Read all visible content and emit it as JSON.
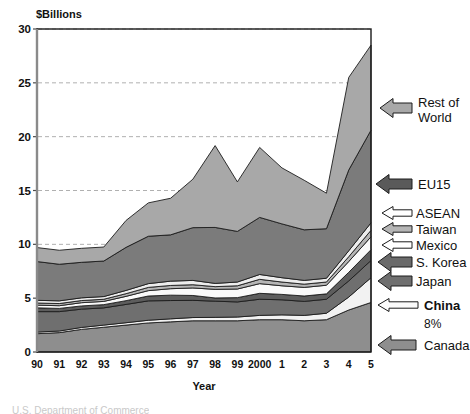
{
  "chart_data": {
    "type": "area",
    "title": "",
    "subtitle": "",
    "unit_label": "$Billions",
    "xlabel": "Year",
    "ylabel": "",
    "ylim": [
      0,
      30
    ],
    "yticks": [
      0,
      5,
      10,
      15,
      20,
      25,
      30
    ],
    "grid": "horizontal-dashed",
    "legend_position": "right-arrows",
    "stacked": true,
    "categories": [
      "90",
      "91",
      "92",
      "93",
      "94",
      "95",
      "96",
      "97",
      "98",
      "99",
      "2000",
      "1",
      "2",
      "3",
      "4",
      "5"
    ],
    "series": [
      {
        "name": "Canada",
        "color": "#8e8e8e",
        "values": [
          1.7,
          1.8,
          2.1,
          2.3,
          2.5,
          2.7,
          2.8,
          2.9,
          2.9,
          2.9,
          3.0,
          3.0,
          2.9,
          3.0,
          3.9,
          4.6
        ]
      },
      {
        "name": "China",
        "color": "#f2f2f2",
        "values": [
          0.15,
          0.15,
          0.18,
          0.2,
          0.22,
          0.25,
          0.28,
          0.3,
          0.32,
          0.35,
          0.4,
          0.45,
          0.5,
          0.6,
          1.2,
          2.3
        ]
      },
      {
        "name": "Japan",
        "color": "#6f6f6f",
        "values": [
          1.9,
          1.8,
          1.7,
          1.6,
          1.7,
          1.8,
          1.7,
          1.6,
          1.5,
          1.4,
          1.5,
          1.4,
          1.3,
          1.3,
          1.5,
          1.6
        ]
      },
      {
        "name": "S. Korea",
        "color": "#5d5d5d",
        "values": [
          0.35,
          0.3,
          0.3,
          0.3,
          0.35,
          0.45,
          0.5,
          0.45,
          0.3,
          0.4,
          0.55,
          0.5,
          0.5,
          0.5,
          0.8,
          1.0
        ]
      },
      {
        "name": "Mexico",
        "color": "#fafafa",
        "values": [
          0.25,
          0.25,
          0.3,
          0.3,
          0.4,
          0.5,
          0.6,
          0.7,
          0.8,
          0.8,
          0.9,
          0.8,
          0.8,
          0.8,
          1.0,
          1.2
        ]
      },
      {
        "name": "Taiwan",
        "color": "#b5b5b5",
        "values": [
          0.2,
          0.2,
          0.2,
          0.2,
          0.25,
          0.3,
          0.3,
          0.3,
          0.25,
          0.3,
          0.4,
          0.35,
          0.3,
          0.3,
          0.45,
          0.6
        ]
      },
      {
        "name": "ASEAN",
        "color": "#ededed",
        "values": [
          0.25,
          0.25,
          0.25,
          0.25,
          0.3,
          0.35,
          0.4,
          0.4,
          0.3,
          0.35,
          0.45,
          0.4,
          0.35,
          0.35,
          0.55,
          0.7
        ]
      },
      {
        "name": "EU15",
        "color": "#7b7b7b",
        "values": [
          3.6,
          3.4,
          3.3,
          3.3,
          4.0,
          4.4,
          4.3,
          4.9,
          5.2,
          4.7,
          5.3,
          5.0,
          4.7,
          4.6,
          7.5,
          8.6
        ]
      },
      {
        "name": "Rest of World",
        "color": "#a8a8a8",
        "values": [
          1.3,
          1.3,
          1.3,
          1.3,
          2.5,
          3.1,
          3.4,
          4.5,
          7.6,
          4.6,
          6.5,
          5.2,
          4.6,
          3.3,
          8.6,
          7.9
        ]
      }
    ],
    "totals": [
      9.7,
      9.45,
      9.63,
      9.75,
      12.17,
      13.85,
      14.28,
      16.05,
      19.17,
      15.8,
      19.0,
      17.1,
      15.95,
      14.75,
      25.5,
      28.5
    ],
    "annotations": [
      {
        "text": "8%",
        "anchor": "China",
        "note": "China share callout"
      }
    ]
  },
  "legend": {
    "items": [
      {
        "label": "Rest of",
        "label2": "World",
        "arrow_fill": "#a8a8a8"
      },
      {
        "label": "EU15",
        "arrow_fill": "#5a5a5a"
      },
      {
        "label": "ASEAN",
        "arrow_fill": "#ffffff"
      },
      {
        "label": "Taiwan",
        "arrow_fill": "#b5b5b5"
      },
      {
        "label": "Mexico",
        "arrow_fill": "#ffffff"
      },
      {
        "label": "S. Korea",
        "arrow_fill": "#6a6a6a"
      },
      {
        "label": "Japan",
        "arrow_fill": "#6f6f6f"
      },
      {
        "label": "China",
        "arrow_fill": "#fbfbfb",
        "sub": "8%"
      },
      {
        "label": "Canada",
        "arrow_fill": "#8e8e8e"
      }
    ]
  },
  "caption": {
    "source_text": "U.S. Department of Commerce"
  }
}
